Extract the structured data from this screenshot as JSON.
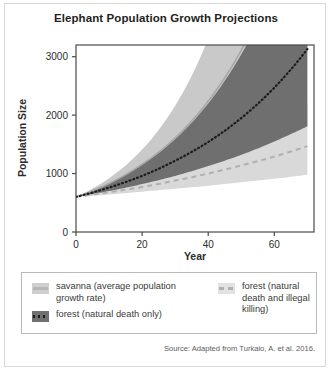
{
  "figure": {
    "title": "Elephant Population Growth Projections",
    "source": "Source: Adapted from Turkalo, A. et al. 2016."
  },
  "legend": {
    "items": [
      {
        "label": "savanna (average population growth rate)",
        "style": "solid",
        "color": "#b6b6b6",
        "swatch_bg": "#cfcfcf",
        "name": "savanna"
      },
      {
        "label": "forest (natural death and illegal killing)",
        "style": "dashed",
        "color": "#b0b0b0",
        "swatch_bg": "#e2e2e2",
        "name": "forest-illegal-killing"
      },
      {
        "label": "forest (natural death only)",
        "style": "dotted",
        "color": "#1c1c1c",
        "swatch_bg": "#707070",
        "name": "forest-natural-death"
      }
    ]
  },
  "chart_data": {
    "type": "line",
    "title": "Elephant Population Growth Projections",
    "xlabel": "Year",
    "ylabel": "Population Size",
    "xlim": [
      0,
      72
    ],
    "ylim": [
      0,
      3200
    ],
    "xticks": [
      0,
      20,
      40,
      60
    ],
    "yticks": [
      0,
      1000,
      2000,
      3000
    ],
    "grid": false,
    "legend_position": "below",
    "start_population": 600,
    "x": [
      0,
      10,
      20,
      30,
      40,
      50,
      60,
      70
    ],
    "series": [
      {
        "name": "savanna (average population growth rate)",
        "style": "solid",
        "color": "#a8a8a8",
        "band_color": "#c9c9c9",
        "values": [
          600,
          830,
          1160,
          1610,
          2240,
          3110,
          4320,
          6000
        ],
        "band_low": [
          600,
          760,
          960,
          1210,
          1530,
          1930,
          2440,
          3080
        ],
        "band_high": [
          600,
          920,
          1410,
          2160,
          3310,
          5070,
          7770,
          11900
        ]
      },
      {
        "name": "forest (natural death only)",
        "style": "dotted",
        "color": "#1c1c1c",
        "band_color": "#6f6f6f",
        "values": [
          600,
          760,
          960,
          1220,
          1540,
          1950,
          2470,
          3130
        ],
        "band_low": [
          600,
          700,
          820,
          960,
          1130,
          1320,
          1550,
          1810
        ],
        "band_high": [
          600,
          830,
          1150,
          1590,
          2200,
          3040,
          4200,
          5810
        ]
      },
      {
        "name": "forest (natural death and illegal killing)",
        "style": "dashed",
        "color": "#b0b0b0",
        "band_color": "#d9d9d9",
        "values": [
          600,
          680,
          770,
          880,
          1000,
          1140,
          1290,
          1470
        ],
        "band_low": [
          600,
          640,
          690,
          740,
          790,
          850,
          910,
          980
        ],
        "band_high": [
          600,
          720,
          870,
          1050,
          1260,
          1520,
          1830,
          2200
        ]
      }
    ]
  }
}
